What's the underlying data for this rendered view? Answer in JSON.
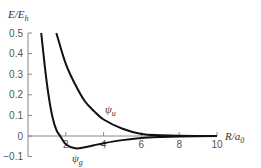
{
  "chart_data": {
    "type": "line",
    "title": "",
    "xlabel": "R/a0",
    "ylabel": "E/Eh",
    "xlim": [
      0,
      10
    ],
    "ylim": [
      -0.1,
      0.5
    ],
    "x_ticks": [
      "2",
      "4",
      "6",
      "8",
      "10"
    ],
    "y_ticks": [
      "0.5",
      "0.4",
      "0.3",
      "0.2",
      "0.1",
      "0",
      "-0.1"
    ],
    "grid": false,
    "legend": "inline labels",
    "series": [
      {
        "name": "ψg",
        "x": [
          0.7,
          0.9,
          1.1,
          1.3,
          1.5,
          1.7,
          2.0,
          2.5,
          3.0,
          3.5,
          4.0,
          5.0,
          6.0,
          7.0,
          8.0,
          10.0
        ],
        "y": [
          0.5,
          0.33,
          0.19,
          0.09,
          0.03,
          0.0,
          -0.04,
          -0.06,
          -0.055,
          -0.045,
          -0.035,
          -0.02,
          -0.01,
          -0.005,
          -0.002,
          0.0
        ]
      },
      {
        "name": "ψu",
        "x": [
          1.5,
          2.0,
          2.5,
          3.0,
          3.5,
          4.0,
          5.0,
          6.0,
          7.0,
          8.0,
          10.0
        ],
        "y": [
          0.5,
          0.35,
          0.25,
          0.17,
          0.12,
          0.08,
          0.035,
          0.01,
          0.004,
          0.001,
          0.0
        ]
      }
    ],
    "annotations": [
      {
        "text": "ψu",
        "x": 4.1,
        "y": 0.12
      },
      {
        "text": "ψg",
        "x": 2.6,
        "y": -0.105
      }
    ]
  },
  "labels": {
    "ylabel_main": "E/E",
    "ylabel_sub": "h",
    "xlabel_main": "R/a",
    "xlabel_sub": "0",
    "psi_u_main": "ψ",
    "psi_u_sub": "u",
    "psi_g_main": "ψ",
    "psi_g_sub": "g"
  }
}
